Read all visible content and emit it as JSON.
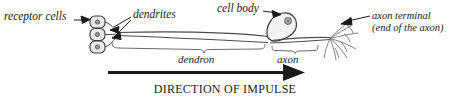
{
  "diagram": {
    "labels": {
      "receptor_cells": "receptor cells",
      "dendrites": "dendrites",
      "cell_body": "cell body",
      "axon_terminal_line1": "axon terminal",
      "axon_terminal_line2": "(end of the axon)",
      "dendron": "dendron",
      "axon": "axon",
      "direction_of_impulse": "DIRECTION OF IMPULSE"
    },
    "parts": {
      "receptor_cell_count": 3,
      "nucleus": "nucleus-dot",
      "leader_arrows": 4,
      "impulse_arrow_direction": "right"
    },
    "colors": {
      "background": "#ffffff",
      "ink": "#1a1a1a",
      "outline": "#4a4a4a",
      "fill_light": "#e8e8e8"
    }
  }
}
